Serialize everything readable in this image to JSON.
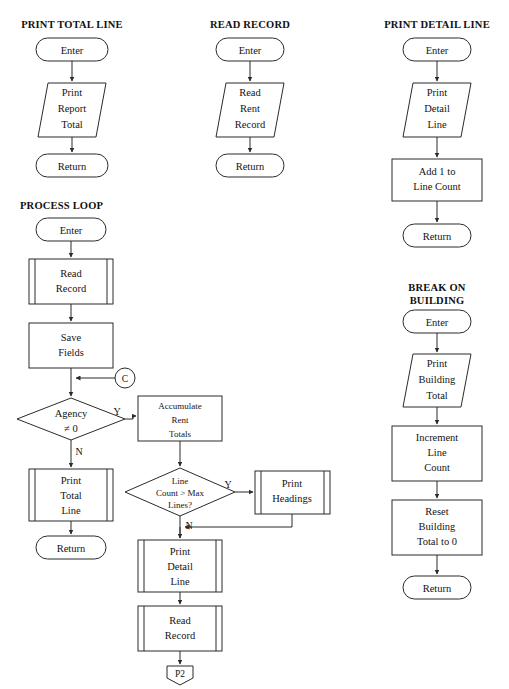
{
  "document": {
    "title": "Program Flowchart Diagram",
    "background_color": "#ffffff",
    "line_color": "#2b2b2b",
    "text_color": "#141414"
  },
  "sections": [
    {
      "id": "print-total-line",
      "title": "PRINT TOTAL LINE",
      "title_lines": [
        "PRINT TOTAL LINE"
      ],
      "nodes": [
        {
          "id": "ptl-enter",
          "shape": "terminator",
          "lines": [
            "Enter"
          ]
        },
        {
          "id": "ptl-print-report-total",
          "shape": "parallelogram",
          "lines": [
            "Print",
            "Report",
            "Total"
          ]
        },
        {
          "id": "ptl-return",
          "shape": "terminator",
          "lines": [
            "Return"
          ]
        }
      ]
    },
    {
      "id": "read-record",
      "title": "READ RECORD",
      "title_lines": [
        "READ RECORD"
      ],
      "nodes": [
        {
          "id": "rr-enter",
          "shape": "terminator",
          "lines": [
            "Enter"
          ]
        },
        {
          "id": "rr-read-rent-record",
          "shape": "parallelogram",
          "lines": [
            "Read",
            "Rent",
            "Record"
          ]
        },
        {
          "id": "rr-return",
          "shape": "terminator",
          "lines": [
            "Return"
          ]
        }
      ]
    },
    {
      "id": "print-detail-line",
      "title": "PRINT DETAIL LINE",
      "title_lines": [
        "PRINT DETAIL LINE"
      ],
      "nodes": [
        {
          "id": "pdl-enter",
          "shape": "terminator",
          "lines": [
            "Enter"
          ]
        },
        {
          "id": "pdl-print-detail-line",
          "shape": "parallelogram",
          "lines": [
            "Print",
            "Detail",
            "Line"
          ]
        },
        {
          "id": "pdl-add-1",
          "shape": "process",
          "lines": [
            "Add 1 to",
            "Line Count"
          ]
        },
        {
          "id": "pdl-return",
          "shape": "terminator",
          "lines": [
            "Return"
          ]
        }
      ]
    },
    {
      "id": "break-on-building",
      "title": "BREAK ON BUILDING",
      "title_lines": [
        "BREAK ON",
        "BUILDING"
      ],
      "nodes": [
        {
          "id": "bob-enter",
          "shape": "terminator",
          "lines": [
            "Enter"
          ]
        },
        {
          "id": "bob-print-building-total",
          "shape": "parallelogram",
          "lines": [
            "Print",
            "Building",
            "Total"
          ]
        },
        {
          "id": "bob-increment",
          "shape": "process",
          "lines": [
            "Increment",
            "Line",
            "Count"
          ]
        },
        {
          "id": "bob-reset",
          "shape": "process",
          "lines": [
            "Reset",
            "Building",
            "Total to 0"
          ]
        },
        {
          "id": "bob-return",
          "shape": "terminator",
          "lines": [
            "Return"
          ]
        }
      ]
    },
    {
      "id": "process-loop",
      "title": "PROCESS LOOP",
      "title_lines": [
        "PROCESS LOOP"
      ],
      "nodes": [
        {
          "id": "pl-enter",
          "shape": "terminator",
          "lines": [
            "Enter"
          ]
        },
        {
          "id": "pl-read-record",
          "shape": "predefined",
          "lines": [
            "Read",
            "Record"
          ]
        },
        {
          "id": "pl-save-fields",
          "shape": "process",
          "lines": [
            "Save",
            "Fields"
          ]
        },
        {
          "id": "pl-connector-c",
          "shape": "connector",
          "lines": [
            "C"
          ]
        },
        {
          "id": "pl-agency",
          "shape": "decision",
          "lines": [
            "Agency",
            "≠ 0"
          ]
        },
        {
          "id": "pl-accumulate",
          "shape": "process",
          "lines": [
            "Accumulate",
            "Rent",
            "Totals"
          ]
        },
        {
          "id": "pl-print-total-line",
          "shape": "predefined",
          "lines": [
            "Print",
            "Total",
            "Line"
          ]
        },
        {
          "id": "pl-return",
          "shape": "terminator",
          "lines": [
            "Return"
          ]
        },
        {
          "id": "pl-line-count",
          "shape": "decision",
          "lines": [
            "Line",
            "Count > Max",
            "Lines?"
          ]
        },
        {
          "id": "pl-print-headings",
          "shape": "predefined",
          "lines": [
            "Print",
            "Headings"
          ]
        },
        {
          "id": "pl-print-detail-line",
          "shape": "predefined",
          "lines": [
            "Print",
            "Detail",
            "Line"
          ]
        },
        {
          "id": "pl-read-record-2",
          "shape": "predefined",
          "lines": [
            "Read",
            "Record"
          ]
        },
        {
          "id": "pl-offpage-p2",
          "shape": "offpage",
          "lines": [
            "P2"
          ]
        }
      ],
      "edge_labels": [
        {
          "id": "agency-yes",
          "text": "Y"
        },
        {
          "id": "agency-no",
          "text": "N"
        },
        {
          "id": "linecount-yes",
          "text": "Y"
        },
        {
          "id": "linecount-no",
          "text": "N"
        }
      ]
    }
  ]
}
